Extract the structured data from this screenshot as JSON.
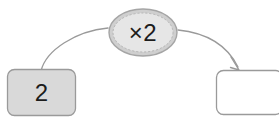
{
  "canvas": {
    "width": 279,
    "height": 119,
    "background_color": "#ffffff"
  },
  "diagram": {
    "type": "function-machine",
    "title": "",
    "input_node": {
      "name": "input-box",
      "value": "2",
      "shape": "rounded-rectangle",
      "fill_color": "#d9d9d9",
      "border_color": "#9a9a9a"
    },
    "operator_node": {
      "name": "operator-bubble",
      "value": "×2",
      "shape": "ellipse",
      "fill_color": "#e6e6e6",
      "border_color": "#a5a5a5",
      "inner_border_style": "dashed"
    },
    "output_node": {
      "name": "output-box",
      "value": "",
      "shape": "rounded-rectangle",
      "fill_color": "#ffffff",
      "border_color": "#9a9a9a"
    },
    "connectors": [
      {
        "name": "input-to-operator-curve",
        "from": "input-box",
        "to": "operator-bubble",
        "arrowhead": false,
        "stroke_color": "#9a9a9a"
      },
      {
        "name": "operator-to-output-curve",
        "from": "operator-bubble",
        "to": "output-box",
        "arrowhead": true,
        "stroke_color": "#9a9a9a"
      }
    ]
  }
}
